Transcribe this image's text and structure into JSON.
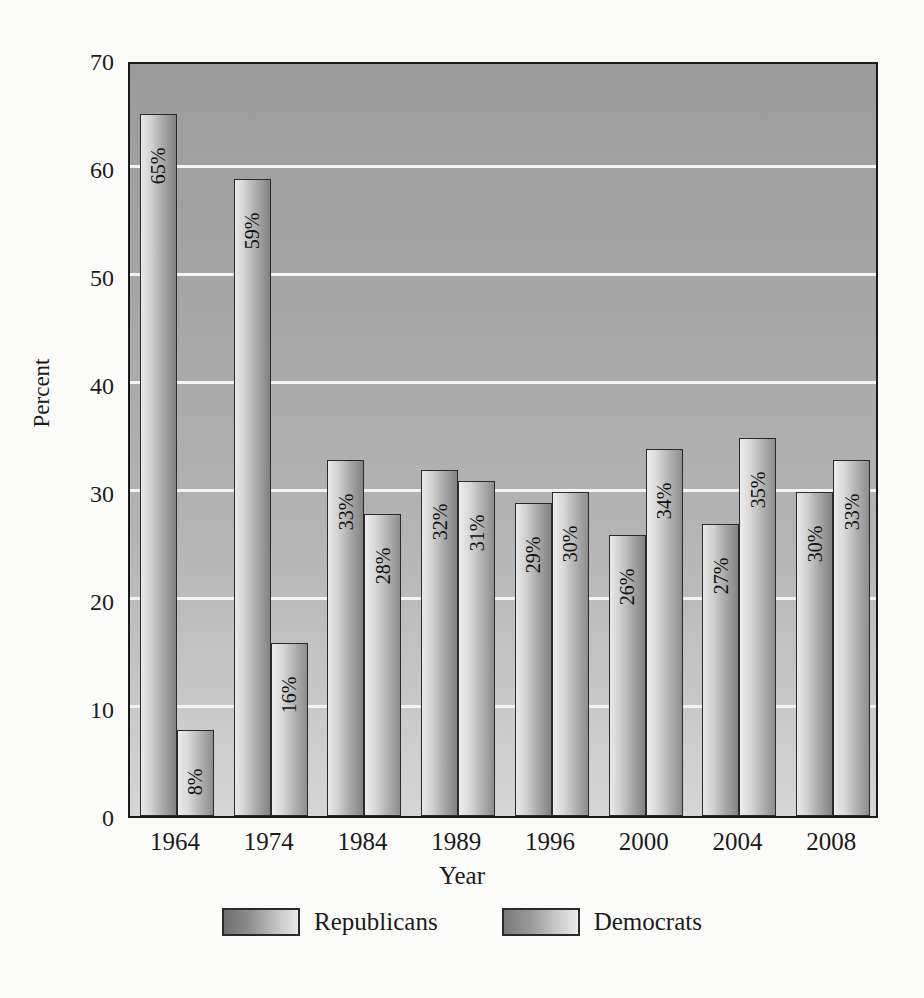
{
  "chart_data": {
    "type": "bar",
    "title": "",
    "xlabel": "Year",
    "ylabel": "Percent",
    "ylim": [
      0,
      70
    ],
    "yticks": [
      0,
      10,
      20,
      30,
      40,
      50,
      60,
      70
    ],
    "grid": true,
    "legend_position": "bottom",
    "categories": [
      "1964",
      "1974",
      "1984",
      "1989",
      "1996",
      "2000",
      "2004",
      "2008"
    ],
    "series": [
      {
        "name": "Republicans",
        "values": [
          65,
          59,
          33,
          32,
          29,
          26,
          27,
          30
        ],
        "labels": [
          "65%",
          "59%",
          "33%",
          "32%",
          "29%",
          "26%",
          "27%",
          "30%"
        ]
      },
      {
        "name": "Democrats",
        "values": [
          8,
          16,
          28,
          31,
          30,
          34,
          35,
          33
        ],
        "labels": [
          "8%",
          "16%",
          "28%",
          "31%",
          "30%",
          "34%",
          "35%",
          "33%"
        ]
      }
    ]
  },
  "axis": {
    "y_title": "Percent",
    "x_title": "Year",
    "y_tick_labels": [
      "70",
      "60",
      "50",
      "40",
      "30",
      "20",
      "10",
      "0"
    ],
    "x_tick_labels": [
      "1964",
      "1974",
      "1984",
      "1989",
      "1996",
      "2000",
      "2004",
      "2008"
    ]
  },
  "legend": {
    "items": [
      {
        "label": "Republicans",
        "swatch": "rep"
      },
      {
        "label": "Democrats",
        "swatch": "dem"
      }
    ]
  },
  "colors": {
    "plot_background_top": "#9c9c9c",
    "plot_background_bottom": "#d6d6d6",
    "gridline": "#f4f4f2",
    "axis_line": "#1a1a1a",
    "bar_border": "#2a2a2a",
    "text": "#1b1b1b",
    "page_background": "#fbfbfa"
  }
}
